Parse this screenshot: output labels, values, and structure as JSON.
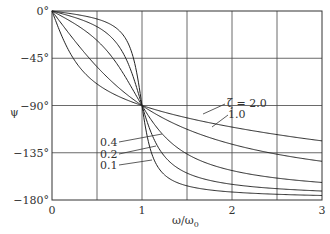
{
  "chart_data": {
    "type": "line",
    "title": "",
    "xlabel": "ω/ω0",
    "ylabel": "ψ",
    "xlim": [
      0,
      3
    ],
    "ylim": [
      -180,
      0
    ],
    "grid": true,
    "x_ticks": [
      {
        "value": 0,
        "label": "0"
      },
      {
        "value": 1,
        "label": "1"
      },
      {
        "value": 2,
        "label": "2"
      },
      {
        "value": 3,
        "label": "3"
      }
    ],
    "y_ticks": [
      {
        "value": 0,
        "label": "0°"
      },
      {
        "value": -45,
        "label": "−45°"
      },
      {
        "value": -90,
        "label": "−90°"
      },
      {
        "value": -135,
        "label": "−135°"
      },
      {
        "value": -180,
        "label": "−180°"
      }
    ],
    "x": [
      0,
      0.25,
      0.5,
      0.75,
      0.9,
      1.0,
      1.1,
      1.25,
      1.5,
      2.0,
      2.5,
      3.0
    ],
    "series": [
      {
        "name": "ζ = 0.1",
        "values": [
          0,
          -3.1,
          -7.6,
          -18.9,
          -43.5,
          -90,
          -133.7,
          -156.1,
          -166.3,
          -172.4,
          -174.6,
          -175.7
        ]
      },
      {
        "name": "ζ = 0.2",
        "values": [
          0,
          -6.1,
          -14.9,
          -34.4,
          -62.2,
          -90,
          -115.3,
          -138.0,
          -154.4,
          -165.1,
          -169.2,
          -171.5
        ]
      },
      {
        "name": "ζ = 0.4",
        "values": [
          0,
          -12.0,
          -28.1,
          -53.8,
          -75.3,
          -90,
          -103.2,
          -120.6,
          -136.4,
          -151.9,
          -158.6,
          -163.3
        ]
      },
      {
        "name": "ζ = 1.0",
        "values": [
          0,
          -28.1,
          -53.1,
          -73.7,
          -83.9,
          -90,
          -95.4,
          -102.7,
          -112.6,
          -126.9,
          -136.4,
          -143.1
        ]
      },
      {
        "name": "ζ = 2.0",
        "values": [
          0,
          -46.8,
          -69.4,
          -81.3,
          -86.9,
          -90,
          -92.7,
          -96.4,
          -101.3,
          -110.6,
          -117.4,
          -123.7
        ]
      }
    ],
    "annotations": [
      {
        "text": "ζ = 2.0",
        "target": "ζ = 2.0"
      },
      {
        "text": "1.0",
        "target": "ζ = 1.0"
      },
      {
        "text": "0.4",
        "target": "ζ = 0.4"
      },
      {
        "text": "0.2",
        "target": "ζ = 0.2"
      },
      {
        "text": "0.1",
        "target": "ζ = 0.1"
      }
    ]
  },
  "labels": {
    "zeta2": "ζ = 2.0",
    "zeta1": "1.0",
    "zeta04": "0.4",
    "zeta02": "0.2",
    "zeta01": "0.1",
    "xaxis": "ω/ω",
    "xaxis_sub": "0",
    "yaxis": "ψ"
  }
}
